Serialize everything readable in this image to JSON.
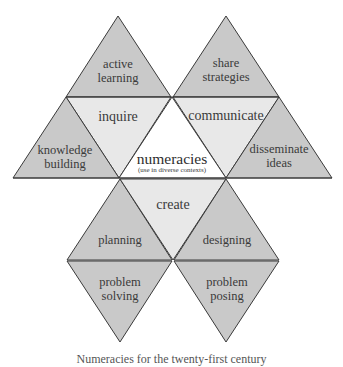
{
  "diagram": {
    "colors": {
      "outer_fill": "#c9c9c9",
      "inner_fill": "#e8e8e8",
      "center_fill": "#ffffff",
      "stroke": "#3a3a3a",
      "text": "#3a3a3a"
    },
    "center": {
      "title": "numeracies",
      "subtitle": "(use in diverse contexts)"
    },
    "inner_triangles": {
      "left": "inquire",
      "right": "communicate",
      "bottom": "create"
    },
    "outer_triangles": {
      "top_left_line1": "active",
      "top_left_line2": "learning",
      "top_right_line1": "share",
      "top_right_line2": "strategies",
      "mid_left_line1": "knowledge",
      "mid_left_line2": "building",
      "mid_right_line1": "disseminate",
      "mid_right_line2": "ideas",
      "lower_left": "planning",
      "lower_right": "designing",
      "bottom_left_line1": "problem",
      "bottom_left_line2": "solving",
      "bottom_right_line1": "problem",
      "bottom_right_line2": "posing"
    },
    "caption": "Numeracies for the twenty-first century"
  }
}
